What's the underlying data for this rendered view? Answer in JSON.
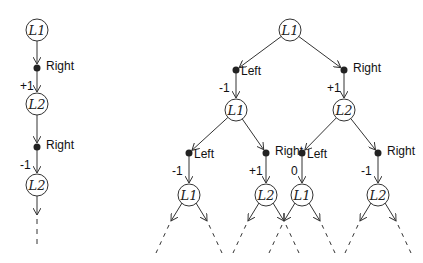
{
  "left_tree": {
    "nodes": [
      {
        "id": "a0",
        "label": "L1",
        "x": 37,
        "y": 30
      },
      {
        "id": "a1",
        "label": "L2",
        "x": 37,
        "y": 104
      },
      {
        "id": "a2",
        "label": "L2",
        "x": 37,
        "y": 185
      }
    ],
    "actions": [
      {
        "dot_x": 37,
        "dot_y": 68,
        "from": "a0",
        "to": "a1",
        "action": "Right",
        "reward": "+1"
      },
      {
        "dot_x": 37,
        "dot_y": 147,
        "from": "a1",
        "to": "a2",
        "action": "Right",
        "reward": "-1"
      }
    ]
  },
  "right_tree": {
    "nodes": [
      {
        "id": "b0",
        "label": "L1",
        "x": 290,
        "y": 30
      },
      {
        "id": "b1",
        "label": "L1",
        "x": 236,
        "y": 110
      },
      {
        "id": "b2",
        "label": "L2",
        "x": 344,
        "y": 110
      },
      {
        "id": "b3",
        "label": "L1",
        "x": 189,
        "y": 195
      },
      {
        "id": "b4",
        "label": "L2",
        "x": 266,
        "y": 195
      },
      {
        "id": "b5",
        "label": "L1",
        "x": 302,
        "y": 195
      },
      {
        "id": "b6",
        "label": "L2",
        "x": 378,
        "y": 195
      }
    ],
    "actions": [
      {
        "dot_x": 236,
        "dot_y": 70,
        "from": "b0",
        "to": "b1",
        "action": "Left",
        "reward": "-1",
        "side": "left"
      },
      {
        "dot_x": 344,
        "dot_y": 70,
        "from": "b0",
        "to": "b2",
        "action": "Right",
        "reward": "+1",
        "side": "right"
      },
      {
        "dot_x": 189,
        "dot_y": 153,
        "from": "b1",
        "to": "b3",
        "action": "Left",
        "reward": "-1",
        "side": "left"
      },
      {
        "dot_x": 266,
        "dot_y": 153,
        "from": "b1",
        "to": "b4",
        "action": "Right",
        "reward": "+1",
        "side": "right"
      },
      {
        "dot_x": 302,
        "dot_y": 153,
        "from": "b2",
        "to": "b5",
        "action": "Left",
        "reward": "0",
        "side": "left"
      },
      {
        "dot_x": 378,
        "dot_y": 153,
        "from": "b2",
        "to": "b6",
        "action": "Right",
        "reward": "-1",
        "side": "right"
      }
    ]
  },
  "colors": {
    "stroke": "#333333",
    "dot": "#222222",
    "text": "#111111"
  }
}
